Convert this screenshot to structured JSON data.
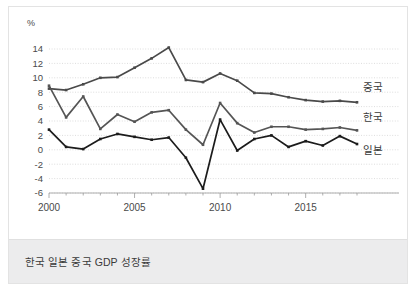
{
  "caption": "한국 일본 중국 GDP 성장률",
  "chart_data": {
    "type": "line",
    "title": "",
    "subtitle": "",
    "xlabel": "",
    "ylabel": "",
    "unit_label": "%",
    "grid": true,
    "legend_position": "right-inline",
    "xlim": [
      2000,
      2018
    ],
    "ylim": [
      -6,
      14
    ],
    "x": [
      2000,
      2001,
      2002,
      2003,
      2004,
      2005,
      2006,
      2007,
      2008,
      2009,
      2010,
      2011,
      2012,
      2013,
      2014,
      2015,
      2016,
      2017,
      2018
    ],
    "xticks": [
      2000,
      2005,
      2010,
      2015
    ],
    "xtick_labels": [
      "2000",
      "2005",
      "2010",
      "2015"
    ],
    "yticks": [
      -6,
      -4,
      -2,
      0,
      2,
      4,
      6,
      8,
      10,
      12,
      14
    ],
    "ytick_labels": [
      "-6",
      "-4",
      "-2",
      "0",
      "2",
      "4",
      "6",
      "8",
      "10",
      "12",
      "14"
    ],
    "series": [
      {
        "name": "중국",
        "label": "중국",
        "color": "#4a4a4a",
        "values": [
          8.5,
          8.3,
          9.1,
          10.0,
          10.1,
          11.4,
          12.7,
          14.2,
          9.7,
          9.4,
          10.6,
          9.6,
          7.9,
          7.8,
          7.3,
          6.9,
          6.7,
          6.8,
          6.6
        ]
      },
      {
        "name": "한국",
        "label": "한국",
        "color": "#555555",
        "values": [
          8.9,
          4.5,
          7.4,
          2.9,
          4.9,
          3.9,
          5.2,
          5.5,
          2.8,
          0.7,
          6.5,
          3.7,
          2.4,
          3.2,
          3.2,
          2.8,
          2.9,
          3.1,
          2.7
        ]
      },
      {
        "name": "일본",
        "label": "일본",
        "color": "#1c1c1c",
        "values": [
          2.8,
          0.4,
          0.1,
          1.5,
          2.2,
          1.8,
          1.4,
          1.7,
          -1.1,
          -5.4,
          4.2,
          -0.1,
          1.5,
          2.0,
          0.4,
          1.2,
          0.6,
          1.9,
          0.8
        ]
      }
    ]
  },
  "icons": {
    "chart_line": "line-chart-icon"
  }
}
